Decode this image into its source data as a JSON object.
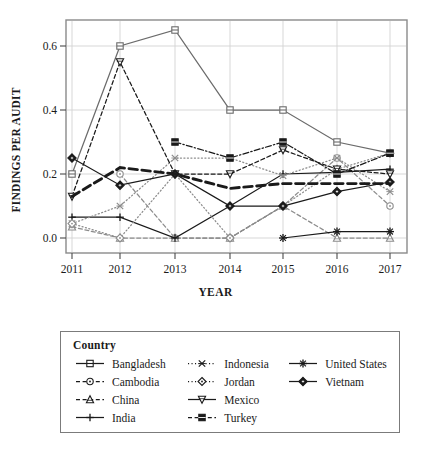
{
  "chart_data": {
    "type": "line",
    "title": "",
    "xlabel": "YEAR",
    "ylabel": "FINDINGS PER AUDIT",
    "x": [
      2011,
      2012,
      2013,
      2014,
      2015,
      2016,
      2017
    ],
    "xtick_labels": [
      "2011",
      "2012",
      "2013",
      "2014",
      "2015",
      "2016",
      "2017"
    ],
    "ytick_labels": [
      "0.0",
      "0.2",
      "0.4",
      "0.6"
    ],
    "ytick_values": [
      0.0,
      0.2,
      0.4,
      0.6
    ],
    "ylim": [
      -0.025,
      0.675
    ],
    "xlim": [
      2010.7,
      2017.3
    ],
    "grid": true,
    "legend_position": "below-plot",
    "legend_title": "Country",
    "series": [
      {
        "name": "Bangladesh",
        "marker": "open-square",
        "line": "solid",
        "color": "#6b6b6b",
        "values": [
          0.2,
          0.6,
          0.65,
          0.4,
          0.4,
          0.3,
          0.265
        ]
      },
      {
        "name": "Cambodia",
        "marker": "open-circle",
        "line": "dashed",
        "color": "#8c8c8c",
        "values": [
          null,
          0.2,
          0.0,
          0.0,
          0.1,
          0.25,
          0.1
        ]
      },
      {
        "name": "China",
        "marker": "open-triangle-up",
        "line": "dashed",
        "color": "#8c8c8c",
        "values": [
          0.035,
          0.0,
          0.0,
          0.0,
          0.1,
          0.0,
          0.0
        ]
      },
      {
        "name": "India",
        "marker": "plus",
        "line": "solid",
        "color": "#1a1a1a",
        "values": [
          0.065,
          0.065,
          0.0,
          0.1,
          0.2,
          0.205,
          0.215
        ]
      },
      {
        "name": "Indonesia",
        "marker": "x-cross",
        "line": "dotted",
        "color": "#8c8c8c",
        "values": [
          0.045,
          0.1,
          0.25,
          0.25,
          0.195,
          0.25,
          0.145
        ]
      },
      {
        "name": "Jordan",
        "marker": "open-diamond",
        "line": "dotted",
        "color": "#8c8c8c",
        "values": [
          0.045,
          0.0,
          0.2,
          0.0,
          0.1,
          0.215,
          0.265
        ]
      },
      {
        "name": "Mexico",
        "marker": "open-triangle-down",
        "line": "dashed",
        "color": "#1a1a1a",
        "values": [
          0.13,
          0.55,
          0.2,
          0.2,
          0.275,
          0.215,
          0.2
        ]
      },
      {
        "name": "Turkey",
        "marker": "filled-square",
        "line": "dash-dot",
        "color": "#1a1a1a",
        "values": [
          null,
          null,
          0.3,
          0.25,
          0.3,
          0.2,
          0.265
        ]
      },
      {
        "name": "United States",
        "marker": "asterisk",
        "line": "solid",
        "color": "#1a1a1a",
        "values": [
          null,
          null,
          null,
          null,
          0.0,
          0.02,
          0.02
        ]
      },
      {
        "name": "Vietnam",
        "marker": "filled-diamond-circle",
        "line": "solid",
        "color": "#1a1a1a",
        "values": [
          0.25,
          0.165,
          0.2,
          0.1,
          0.1,
          0.145,
          0.175
        ]
      },
      {
        "name": "trend-thick-dashed",
        "marker": "none",
        "line": "thick-dashed",
        "color": "#1a1a1a",
        "values": [
          0.13,
          0.22,
          0.2,
          0.155,
          0.17,
          0.17,
          0.17
        ]
      }
    ]
  },
  "legend": {
    "title": "Country",
    "columns": [
      {
        "items": [
          {
            "label": "Bangladesh",
            "marker": "open-square",
            "line": "solid"
          },
          {
            "label": "Cambodia",
            "marker": "open-circle",
            "line": "dashed"
          },
          {
            "label": "China",
            "marker": "open-triangle-up",
            "line": "dashed"
          },
          {
            "label": "India",
            "marker": "plus",
            "line": "solid"
          }
        ]
      },
      {
        "items": [
          {
            "label": "Indonesia",
            "marker": "x-cross",
            "line": "dotted"
          },
          {
            "label": "Jordan",
            "marker": "open-diamond",
            "line": "dotted"
          },
          {
            "label": "Mexico",
            "marker": "open-triangle-down",
            "line": "solid"
          },
          {
            "label": "Turkey",
            "marker": "filled-square",
            "line": "dashed"
          }
        ]
      },
      {
        "items": [
          {
            "label": "United States",
            "marker": "asterisk",
            "line": "solid"
          },
          {
            "label": "Vietnam",
            "marker": "filled-diamond-circle",
            "line": "solid"
          }
        ]
      }
    ]
  },
  "axes": {
    "y_title": "FINDINGS PER AUDIT",
    "x_title": "YEAR"
  }
}
